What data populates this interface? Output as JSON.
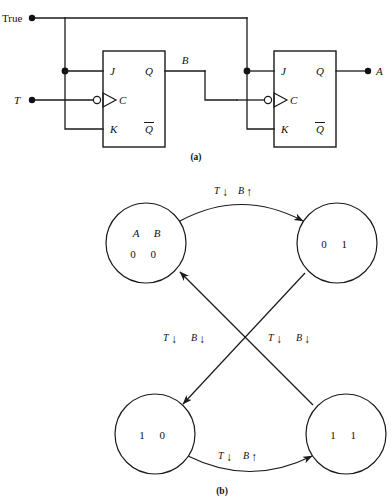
{
  "figure": {
    "captions": {
      "a": "(a)",
      "b": "(b)"
    }
  },
  "circuit": {
    "inputs": [
      {
        "name": "true-input",
        "label": "True"
      },
      {
        "name": "t-input",
        "label": "T"
      }
    ],
    "outputs": [
      {
        "name": "b-output",
        "label": "B"
      },
      {
        "name": "a-output",
        "label": "A"
      }
    ],
    "flipflops": [
      {
        "id": "ff-b",
        "pins": {
          "j": "J",
          "k": "K",
          "c": "C",
          "q": "Q",
          "qbar": "Q"
        }
      },
      {
        "id": "ff-a",
        "pins": {
          "j": "J",
          "k": "K",
          "c": "C",
          "q": "Q",
          "qbar": "Q"
        }
      }
    ]
  },
  "state_diagram": {
    "header": {
      "var1": "A",
      "var2": "B"
    },
    "states": [
      {
        "id": "s00",
        "a": "0",
        "b": "0",
        "label": "0 0",
        "position": "top-left"
      },
      {
        "id": "s01",
        "a": "0",
        "b": "1",
        "label": "0 1",
        "position": "top-right"
      },
      {
        "id": "s10",
        "a": "1",
        "b": "0",
        "label": "1 0",
        "position": "bottom-left"
      },
      {
        "id": "s11",
        "a": "1",
        "b": "1",
        "label": "1 1",
        "position": "bottom-right"
      }
    ],
    "transitions": [
      {
        "id": "t-00-to-01",
        "from": "s00",
        "to": "s01",
        "label_var1": "T",
        "label_arrow1": "↓",
        "label_var2": "B",
        "label_arrow2": "↑",
        "label": "T↓ B↑",
        "position": "top"
      },
      {
        "id": "t-01-to-10",
        "from": "s01",
        "to": "s10",
        "label_var1": "T",
        "label_arrow1": "↓",
        "label_var2": "B",
        "label_arrow2": "↓",
        "label": "T↓ B↓",
        "position": "middle-left"
      },
      {
        "id": "t-11-to-00",
        "from": "s11",
        "to": "s00",
        "label_var1": "T",
        "label_arrow1": "↓",
        "label_var2": "B",
        "label_arrow2": "↓",
        "label": "T↓ B↓",
        "position": "middle-right"
      },
      {
        "id": "t-10-to-11",
        "from": "s10",
        "to": "s11",
        "label_var1": "T",
        "label_arrow1": "↓",
        "label_var2": "B",
        "label_arrow2": "↑",
        "label": "T↓ B↑",
        "position": "bottom"
      }
    ]
  },
  "colors": {
    "ink": "#1a1a1a",
    "background": "#ffffff"
  }
}
